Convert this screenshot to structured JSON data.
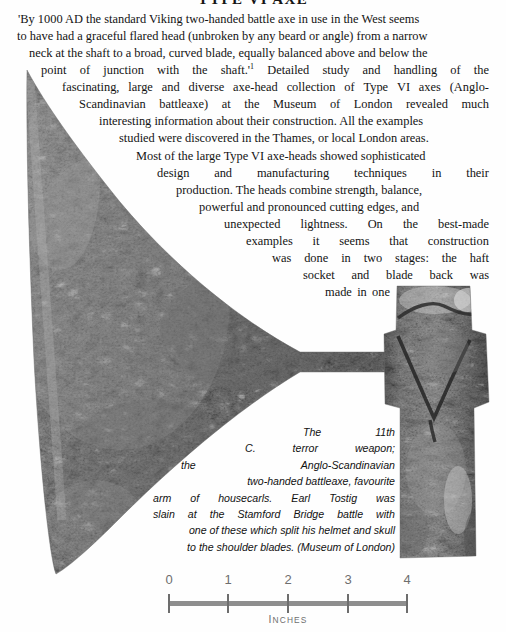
{
  "page": {
    "heading": "TYPE VI AXE",
    "background": "#ffffff"
  },
  "figure": {
    "name": "viking-type-vi-axe-head-photograph",
    "metal_tone": "#8b8b8b",
    "shadow_tone": "#4a4a4a",
    "highlight_tone": "#d8d8d8"
  },
  "body": {
    "paragraph1_lines": [
      "'By 1000 AD the standard Viking two-handed battle axe in use in the West seems",
      "to have had a graceful flared head (unbroken by any beard or angle) from a narrow",
      "neck at the shaft to a broad, curved blade, equally balanced above and below the",
      [
        "point",
        "of",
        "junction",
        "with",
        "the",
        "shaft.'",
        "Detailed",
        "study",
        "and",
        "handling",
        "of",
        "the"
      ],
      [
        "fascinating,",
        "large",
        "and",
        "diverse",
        "axe-head",
        "collection",
        "of",
        "Type",
        "VI",
        "axes",
        "(Anglo-"
      ],
      [
        "Scandinavian",
        "battleaxe)",
        "at",
        "the",
        "Museum",
        "of",
        "London",
        "revealed",
        "much"
      ],
      "interesting information about their construction. All the examples",
      "studied were discovered in the Thames, or local London areas."
    ],
    "footnote_marker": "1",
    "paragraph2_lines": [
      "Most of the large Type VI axe-heads showed sophisticated",
      [
        "design",
        "and",
        "manufacturing",
        "techniques",
        "in",
        "their"
      ],
      "production. The heads combine strength, balance,",
      "powerful and pronounced cutting edges, and",
      [
        "unexpected",
        "lightness.",
        "On",
        "the",
        "best-made"
      ],
      [
        "examples",
        "it",
        "seems",
        "that",
        "construction"
      ],
      [
        "was",
        "done",
        "in",
        "two",
        "stages:",
        "the",
        "haft"
      ],
      [
        "socket",
        "and",
        "blade",
        "back",
        "was"
      ],
      [
        "made",
        "in",
        "one"
      ]
    ]
  },
  "caption": {
    "lines": [
      [
        "The",
        "11th"
      ],
      [
        "C.",
        "terror",
        "weapon;"
      ],
      [
        "the",
        "Anglo-Scandinavian"
      ],
      "two-handed battleaxe, favourite",
      [
        "arm",
        "of",
        "housecarls.",
        "Earl",
        "Tostig",
        "was"
      ],
      [
        "slain",
        "at",
        "the",
        "Stamford",
        "Bridge",
        "battle",
        "with"
      ],
      "one of these which split his helmet and skull",
      "to the shoulder blades. (Museum of London)"
    ],
    "credit": "Museum of London"
  },
  "scale": {
    "unit_label": "INCHES",
    "unit_label_initial": "I",
    "unit_label_rest": "NCHES",
    "ticks": [
      "0",
      "1",
      "2",
      "3",
      "4"
    ],
    "min": 0,
    "max": 4,
    "bar_color": "#8e8e8e",
    "tick_color": "#6d6d6d",
    "label_color": "#6e6e6e"
  }
}
